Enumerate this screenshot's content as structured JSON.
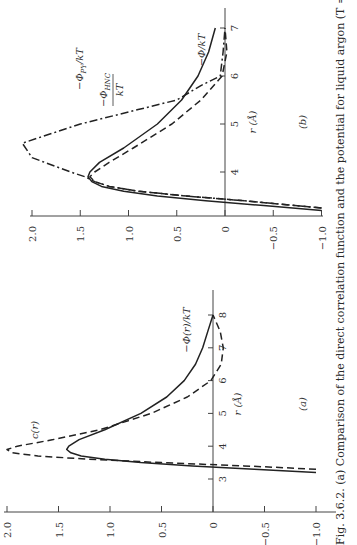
{
  "caption": "Fig. 3.6.2. (a) Comparison of the direct correlation function and the potential for liquid argon (T = 85.5 °K,",
  "chart_data": [
    {
      "panel": "(a)",
      "type": "line",
      "orientation": "rotated 90° (r axis vertical, value axis horizontal)",
      "xlabel": "r (Å)",
      "ylabel": "",
      "x_ticks": [
        "3",
        "4",
        "5",
        "6",
        "7",
        "8"
      ],
      "y_ticks": [
        "2.0",
        "1.5",
        "1.0",
        "0.5",
        "0",
        "−0.5",
        "−1.0"
      ],
      "ylim": [
        -1.0,
        2.0
      ],
      "xlim": [
        3,
        8
      ],
      "series": [
        {
          "name": "c(r)",
          "style": "dashed",
          "x": [
            3.3,
            3.4,
            3.5,
            3.6,
            3.7,
            3.8,
            3.9,
            4.0,
            4.2,
            4.5,
            5.0,
            5.5,
            6.0,
            6.5,
            7.0,
            7.5,
            8.0
          ],
          "y": [
            -1.0,
            -0.3,
            0.5,
            1.2,
            1.7,
            1.95,
            2.0,
            1.9,
            1.55,
            1.1,
            0.6,
            0.25,
            0.02,
            -0.08,
            -0.1,
            -0.07,
            0.0
          ]
        },
        {
          "name": "−Φ(r)/kT",
          "style": "solid",
          "x": [
            3.2,
            3.3,
            3.4,
            3.5,
            3.6,
            3.7,
            3.8,
            3.9,
            4.0,
            4.2,
            4.5,
            5.0,
            5.5,
            6.0,
            6.5,
            7.0,
            7.5,
            8.0
          ],
          "y": [
            -1.0,
            -0.4,
            0.2,
            0.7,
            1.05,
            1.28,
            1.38,
            1.42,
            1.4,
            1.3,
            1.05,
            0.7,
            0.45,
            0.28,
            0.17,
            0.1,
            0.05,
            0.0
          ]
        }
      ],
      "annotations": [
        "c(r)",
        "−Φ(r)/kT"
      ]
    },
    {
      "panel": "(b)",
      "type": "line",
      "orientation": "rotated 90° (r axis vertical, value axis horizontal)",
      "xlabel": "r (Å)",
      "ylabel": "",
      "x_ticks": [
        "4",
        "5",
        "6",
        "7"
      ],
      "y_ticks": [
        "2.0",
        "1.5",
        "1.0",
        "0.5",
        "0",
        "−0.5",
        "−1.0"
      ],
      "ylim": [
        -1.0,
        2.0
      ],
      "xlim": [
        3.1,
        7
      ],
      "series": [
        {
          "name": "−Φ/kT",
          "style": "solid",
          "x": [
            3.2,
            3.3,
            3.4,
            3.5,
            3.6,
            3.7,
            3.8,
            3.9,
            4.0,
            4.2,
            4.5,
            5.0,
            5.5,
            6.0,
            6.5,
            7.0
          ],
          "y": [
            -1.0,
            -0.4,
            0.2,
            0.7,
            1.05,
            1.28,
            1.38,
            1.42,
            1.4,
            1.3,
            1.05,
            0.7,
            0.45,
            0.28,
            0.17,
            0.1
          ]
        },
        {
          "name": "−Φ_HNC/kT",
          "style": "dashed",
          "x": [
            3.25,
            3.4,
            3.5,
            3.6,
            3.7,
            3.8,
            3.9,
            4.0,
            4.2,
            4.5,
            5.0,
            5.5,
            6.0,
            6.5,
            7.0
          ],
          "y": [
            -1.0,
            -0.2,
            0.4,
            0.9,
            1.2,
            1.35,
            1.4,
            1.35,
            1.2,
            0.95,
            0.55,
            0.25,
            0.03,
            -0.02,
            0.0
          ]
        },
        {
          "name": "−Φ_PY/kT",
          "style": "dash-dot",
          "x": [
            3.25,
            3.4,
            3.5,
            3.6,
            3.7,
            3.8,
            3.9,
            4.0,
            4.3,
            4.6,
            5.0,
            5.3,
            5.5,
            5.8,
            6.0,
            6.5,
            7.0
          ],
          "y": [
            -1.0,
            -0.2,
            0.4,
            0.9,
            1.2,
            1.35,
            1.45,
            1.6,
            2.0,
            2.1,
            1.5,
            0.9,
            0.5,
            0.25,
            0.05,
            0.02,
            0.0
          ]
        }
      ],
      "annotations": [
        "−Φ_PY/kT",
        "−Φ_HNC/kT",
        "−Φ/kT"
      ]
    }
  ],
  "panel_a": {
    "tag": "(a)",
    "r_axis_label": "r (Å)",
    "label_c": "c(r)",
    "label_phi": "−Φ(r)/kT"
  },
  "panel_b": {
    "tag": "(b)",
    "r_axis_label": "r (Å)",
    "label_py": "−Φ",
    "label_py_sub": "PY",
    "label_py_tail": "/kT",
    "label_hnc": "−Φ",
    "label_hnc_sub": "HNC",
    "label_hnc_den": "kT",
    "label_phi": "−Φ/kT"
  }
}
